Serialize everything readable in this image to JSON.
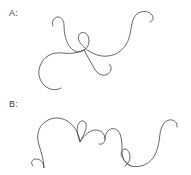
{
  "canvas": {
    "width": 191,
    "height": 175,
    "background_color": "#ffffff"
  },
  "stroke": {
    "color": "#4a4a4a",
    "width": 0.85
  },
  "panels": [
    {
      "id": "a",
      "label": "A:",
      "description": "single continuous open curve with a central figure-eight knot, upper-left hook, large right arch, lower-left lobe and lower-right hook"
    },
    {
      "id": "b",
      "label": "B:",
      "description": "single continuous open curve with two large arches, each containing a small teardrop loop, joined by a central dip"
    }
  ],
  "curves": {
    "a": {
      "label": "A:",
      "path": "M 53 26 C 51 22 54 17 58 17 C 62 17 64 21 64 25 C 64 34 66 42 70 47 C 74 52 79 53 84 50 C 89 47 90 41 88 36 C 86 32 81 31 79 35 C 77 39 80 44 85 48 C 92 54 100 57 108 56 C 118 55 126 48 129 38 C 132 28 131 19 137 14 C 142 10 149 11 152 15 C 154 18 153 21 150 22 M 84 50 C 78 53 70 54 63 53 C 54 52 46 55 42 62 C 37 70 38 79 44 85 C 49 90 56 91 61 88 M 84 50 C 87 56 91 62 94 68 C 97 74 103 77 108 74 C 112 71 112 66 109 64"
    },
    "b": {
      "label": "B:",
      "path": "M 33 166 C 30 163 32 159 36 159 C 41 159 44 163 44 168 C 44 160 41 152 39 145 C 36 136 38 127 45 122 C 53 116 63 117 70 123 C 76 128 79 135 80 142 C 77 134 76 127 79 123 C 81 120 85 120 86 124 C 87 129 84 134 80 142 C 84 135 90 130 96 130 C 101 130 105 134 105 139 C 105 143 102 145 99 144 M 105 139 C 105 136 106 132 109 130 C 113 127 118 129 120 134 C 122 139 122 145 122 151 C 122 158 125 164 131 166 C 139 168 148 165 153 158 C 158 151 159 142 160 134 C 161 127 164 121 169 120 C 174 119 178 123 177 127 M 131 166 C 128 164 124 161 122 157 C 120 153 122 149 125 149 C 128 149 130 153 130 157 C 130 161 128 164 125 166"
    }
  }
}
